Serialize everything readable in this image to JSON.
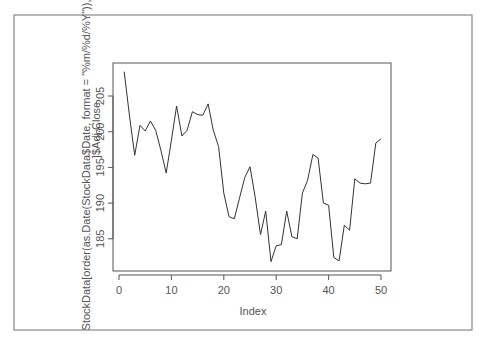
{
  "chart_data": {
    "type": "line",
    "title": "",
    "xlabel": "Index",
    "ylabel_lines": [
      "StockData[order(as.Date(StockData$Date, format = \"%m/%d/%Y\")),",
      "]$Adj.Close"
    ],
    "ylabel": "StockData[order(as.Date(StockData$Date, format = \"%m/%d/%Y\")), ]$Adj.Close",
    "xlim": [
      0,
      51
    ],
    "ylim": [
      180.5,
      209.5
    ],
    "x_ticks": [
      0,
      10,
      20,
      30,
      40,
      50
    ],
    "y_ticks": [
      185,
      190,
      195,
      200,
      205
    ],
    "grid": false,
    "legend": null,
    "x": [
      1,
      2,
      3,
      4,
      5,
      6,
      7,
      8,
      9,
      10,
      11,
      12,
      13,
      14,
      15,
      16,
      17,
      18,
      19,
      20,
      21,
      22,
      23,
      24,
      25,
      26,
      27,
      28,
      29,
      30,
      31,
      32,
      33,
      34,
      35,
      36,
      37,
      38,
      39,
      40,
      41,
      42,
      43,
      44,
      45,
      46,
      47,
      48,
      49,
      50
    ],
    "series": [
      {
        "name": "Adj.Close",
        "color": "#333333",
        "values": [
          208.4,
          202.2,
          196.7,
          200.9,
          200.1,
          201.5,
          200.2,
          197.4,
          194.2,
          198.8,
          203.6,
          199.4,
          200.2,
          202.8,
          202.4,
          202.3,
          203.9,
          200.2,
          197.9,
          191.4,
          188.1,
          187.8,
          190.7,
          193.6,
          195.1,
          190.8,
          185.6,
          188.9,
          181.8,
          184.0,
          184.2,
          188.9,
          185.3,
          185.0,
          191.4,
          193.2,
          196.8,
          196.3,
          190.0,
          189.7,
          182.4,
          181.9,
          186.9,
          186.2,
          193.4,
          192.8,
          192.7,
          192.8,
          198.4,
          199.0
        ]
      }
    ]
  },
  "layout": {
    "frame": {
      "x": 14,
      "y": 15,
      "w": 458,
      "h": 315
    },
    "plot": {
      "x": 113,
      "y": 63,
      "w": 278,
      "h": 208
    },
    "x_px_per_unit": 5.24,
    "x_origin_px": 119,
    "y_px_per_unit": 7.14,
    "y_ref_value": 205,
    "y_ref_px": 96
  },
  "colors": {
    "frame": "#888888",
    "axis": "#555555",
    "line": "#333333",
    "text": "#555555"
  }
}
